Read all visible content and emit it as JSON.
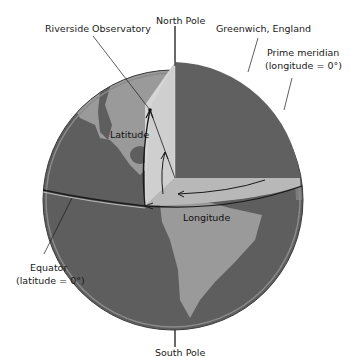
{
  "diagram": {
    "labels": {
      "north_pole": "North Pole",
      "south_pole": "South Pole",
      "riverside": "Riverside Observatory",
      "greenwich": "Greenwich, England",
      "prime_meridian_1": "Prime meridian",
      "prime_meridian_2": "(longitude = 0°)",
      "equator_1": "Equator",
      "equator_2": "(latitude = 0°)",
      "latitude": "Latitude",
      "longitude": "Longitude"
    },
    "colors": {
      "ocean": "#5e5e5e",
      "land": "#9a9a9a",
      "wedge_light": "#d6d6d6",
      "wedge_mid": "#b4b4b4",
      "rim": "#8a8a8a",
      "line": "#1a1a1a",
      "background": "#ffffff"
    }
  }
}
